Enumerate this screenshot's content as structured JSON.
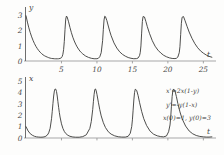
{
  "figure": {
    "title": "",
    "background": "#fdfdfc",
    "curve_color": "#3a3a38",
    "axis_color": "#a8a8a8"
  },
  "annotations": {
    "equation_1": "x'=2x(1-y)",
    "equation_2": "y'=-y(1-x)",
    "equation_3": "x(0)=1, y(0)=3"
  },
  "chart_data": [
    {
      "type": "line",
      "title": "",
      "xlabel": "t",
      "ylabel": "y",
      "xlim": [
        0,
        26.5
      ],
      "ylim": [
        0,
        3.45
      ],
      "grid": false,
      "legend": "none",
      "xticks": [
        5,
        10,
        15,
        20,
        25
      ],
      "xtick_labels": [
        "5",
        "10",
        "15",
        "20",
        "25"
      ],
      "yticks": [
        0,
        1,
        2,
        3
      ],
      "ytick_labels": [
        "0",
        "1",
        "2",
        "3"
      ],
      "series": [
        {
          "name": "y(t)",
          "peak_value": 3.0,
          "trough_value": 0.12,
          "period": 5.4,
          "peak_times": [
            0.0,
            5.6,
            11.0,
            16.3,
            21.8
          ],
          "x": [
            0.0,
            0.2,
            0.4,
            0.6,
            0.8,
            1.0,
            1.2,
            1.4,
            1.6,
            1.8,
            2.0,
            2.2,
            2.4,
            2.6,
            2.8,
            3.0,
            3.2,
            3.4,
            3.6,
            3.8,
            4.0,
            4.2,
            4.4,
            4.6,
            4.8,
            5.0,
            5.1,
            5.2,
            5.3,
            5.4,
            5.5,
            5.6,
            5.7,
            5.8,
            6.0,
            6.2,
            6.4,
            6.6,
            6.8,
            7.0,
            7.2,
            7.4,
            7.6,
            7.8,
            8.0,
            8.4,
            8.8,
            9.2,
            9.6,
            10.0,
            10.2,
            10.4,
            10.6,
            10.8,
            10.9,
            11.0,
            11.1,
            11.2,
            11.4,
            11.6,
            11.8,
            12.0,
            12.4,
            12.8,
            13.2,
            13.6,
            14.0,
            14.4,
            14.8,
            15.2,
            15.6,
            15.8,
            16.0,
            16.1,
            16.2,
            16.3,
            16.4,
            16.5,
            16.7,
            16.9,
            17.1,
            17.4,
            17.8,
            18.2,
            18.6,
            19.0,
            19.4,
            19.8,
            20.2,
            20.6,
            21.0,
            21.2,
            21.4,
            21.6,
            21.7,
            21.8,
            21.9,
            22.0,
            22.2,
            22.4,
            22.7,
            23.0,
            23.4,
            23.8,
            24.2,
            24.6,
            25.0,
            25.4,
            25.8,
            26.2
          ],
          "y": [
            3.0,
            2.58,
            2.2,
            1.88,
            1.6,
            1.36,
            1.15,
            0.97,
            0.82,
            0.69,
            0.58,
            0.49,
            0.41,
            0.35,
            0.3,
            0.26,
            0.22,
            0.19,
            0.17,
            0.16,
            0.15,
            0.145,
            0.145,
            0.15,
            0.17,
            0.22,
            0.3,
            0.45,
            0.75,
            1.3,
            2.1,
            2.78,
            2.98,
            2.92,
            2.6,
            2.22,
            1.88,
            1.58,
            1.33,
            1.12,
            0.94,
            0.79,
            0.66,
            0.56,
            0.47,
            0.33,
            0.24,
            0.18,
            0.15,
            0.15,
            0.18,
            0.28,
            0.55,
            1.35,
            2.1,
            2.72,
            2.97,
            2.94,
            2.68,
            2.32,
            1.98,
            1.68,
            1.2,
            0.86,
            0.61,
            0.44,
            0.32,
            0.23,
            0.18,
            0.15,
            0.16,
            0.2,
            0.35,
            0.55,
            1.0,
            1.85,
            2.62,
            2.95,
            2.92,
            2.62,
            2.28,
            1.84,
            1.35,
            0.98,
            0.72,
            0.53,
            0.38,
            0.28,
            0.21,
            0.17,
            0.16,
            0.18,
            0.26,
            0.55,
            0.95,
            1.75,
            2.5,
            2.9,
            2.95,
            2.7,
            2.3,
            1.92,
            1.5,
            1.15,
            0.88,
            0.67,
            0.52,
            0.4,
            0.31,
            0.25
          ]
        }
      ]
    },
    {
      "type": "line",
      "title": "",
      "xlabel": "t",
      "ylabel": "x",
      "xlim": [
        0,
        26.5
      ],
      "ylim": [
        0,
        5.2
      ],
      "grid": false,
      "legend": "none",
      "xticks": [
        5,
        10,
        15,
        20,
        25
      ],
      "xtick_labels": [
        "",
        "",
        "",
        "",
        ""
      ],
      "yticks": [
        0,
        1,
        2,
        3,
        4,
        5
      ],
      "ytick_labels": [
        "0",
        "1",
        "2",
        "3",
        "4",
        "5"
      ],
      "series": [
        {
          "name": "x(t)",
          "peak_value": 4.35,
          "trough_value": 0.05,
          "period": 5.4,
          "peak_times": [
            4.3,
            9.7,
            15.1,
            20.5
          ],
          "x": [
            0.0,
            0.3,
            0.6,
            0.9,
            1.2,
            1.5,
            1.8,
            2.1,
            2.4,
            2.7,
            3.0,
            3.2,
            3.4,
            3.6,
            3.7,
            3.8,
            3.9,
            4.0,
            4.1,
            4.2,
            4.3,
            4.4,
            4.5,
            4.6,
            4.7,
            4.8,
            5.0,
            5.2,
            5.4,
            5.6,
            5.9,
            6.2,
            6.6,
            7.0,
            7.5,
            8.0,
            8.5,
            9.0,
            9.2,
            9.4,
            9.5,
            9.6,
            9.7,
            9.8,
            9.9,
            10.0,
            10.2,
            10.4,
            10.6,
            10.9,
            11.2,
            11.6,
            12.0,
            12.5,
            13.0,
            13.5,
            14.0,
            14.4,
            14.7,
            14.9,
            15.0,
            15.1,
            15.2,
            15.3,
            15.4,
            15.6,
            15.8,
            16.0,
            16.3,
            16.6,
            17.0,
            17.5,
            18.0,
            18.5,
            19.0,
            19.4,
            19.8,
            20.1,
            20.3,
            20.4,
            20.5,
            20.6,
            20.7,
            20.8,
            21.0,
            21.2,
            21.4,
            21.7,
            22.0,
            22.5,
            23.0,
            23.5,
            24.0,
            24.5,
            25.0,
            25.4,
            25.8,
            26.2
          ],
          "y": [
            1.0,
            0.62,
            0.38,
            0.24,
            0.15,
            0.1,
            0.08,
            0.07,
            0.08,
            0.12,
            0.25,
            0.45,
            0.85,
            1.7,
            2.35,
            3.05,
            3.7,
            4.15,
            4.32,
            4.3,
            4.1,
            3.7,
            3.2,
            2.7,
            2.25,
            1.85,
            1.25,
            0.85,
            0.58,
            0.4,
            0.24,
            0.15,
            0.09,
            0.07,
            0.07,
            0.12,
            0.28,
            0.85,
            1.45,
            2.5,
            3.2,
            3.85,
            4.28,
            4.32,
            4.15,
            3.85,
            3.15,
            2.5,
            1.95,
            1.35,
            0.92,
            0.55,
            0.34,
            0.19,
            0.11,
            0.08,
            0.08,
            0.15,
            0.42,
            1.0,
            1.6,
            2.45,
            3.35,
            4.0,
            4.3,
            4.2,
            3.75,
            3.15,
            2.35,
            1.7,
            1.1,
            0.6,
            0.33,
            0.19,
            0.12,
            0.1,
            0.18,
            0.55,
            1.15,
            1.85,
            2.8,
            3.65,
            4.18,
            4.32,
            4.15,
            3.65,
            3.05,
            2.3,
            1.7,
            1.05,
            0.62,
            0.37,
            0.22,
            0.14,
            0.1,
            0.08,
            0.08,
            0.1
          ]
        }
      ]
    }
  ]
}
